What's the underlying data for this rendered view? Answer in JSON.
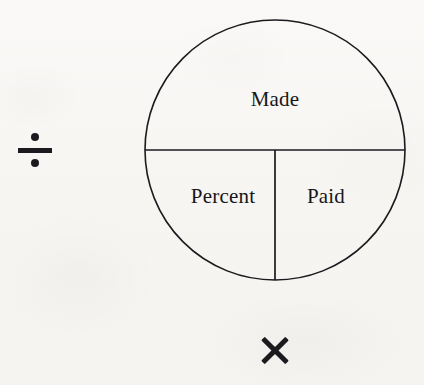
{
  "page": {
    "background_color": "#f8f7f5",
    "ink_color": "#17161a"
  },
  "diagram": {
    "type": "percent-circle",
    "shape": "circle",
    "center_x": 275,
    "center_y": 150,
    "radius": 130,
    "stroke_color": "#1b1a1e",
    "stroke_width": 1.6,
    "fill": "none",
    "divider_lines": [
      {
        "name": "horizontal-diameter",
        "from_x": 145,
        "from_y": 150,
        "to_x": 405,
        "to_y": 150
      },
      {
        "name": "vertical-lower-radius",
        "from_x": 275,
        "from_y": 150,
        "to_x": 275,
        "to_y": 280
      }
    ],
    "segments": [
      {
        "id": "made",
        "label": "Made",
        "position": "top-half"
      },
      {
        "id": "percent",
        "label": "Percent",
        "position": "bottom-left-quarter"
      },
      {
        "id": "paid",
        "label": "Paid",
        "position": "bottom-right-quarter"
      }
    ]
  },
  "operators": [
    {
      "id": "divide",
      "glyph": "÷",
      "name": "division-sign",
      "position": "left-of-circle",
      "meaning": "Made divided by the lower row"
    },
    {
      "id": "multiply",
      "glyph": "×",
      "name": "multiplication-sign",
      "position": "below-circle",
      "meaning": "Percent multiplied by Paid"
    }
  ]
}
